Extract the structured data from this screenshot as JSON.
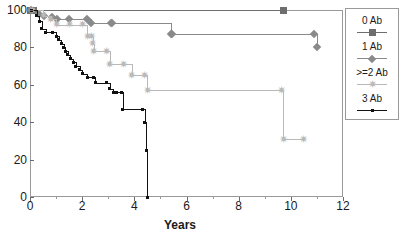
{
  "top_clipped_text": "",
  "legend": {
    "entries": [
      {
        "label": "0 Ab",
        "marker": "square-marker",
        "color": "#6e6e6e"
      },
      {
        "label": "1 Ab",
        "marker": "diamond-marker",
        "color": "#8a8a8a"
      },
      {
        "label": ">=2 Ab",
        "marker": "star-marker",
        "color": "#b9b9b9"
      },
      {
        "label": "3 Ab",
        "marker": "dot-marker",
        "color": "#111111"
      }
    ]
  },
  "chart_data": {
    "type": "line",
    "title": "",
    "xlabel": "Years",
    "ylabel": "",
    "xlim": [
      0,
      12
    ],
    "ylim": [
      0,
      100
    ],
    "xticks": [
      0,
      2,
      4,
      6,
      8,
      10,
      12
    ],
    "yticks": [
      0,
      20,
      40,
      60,
      80,
      100
    ],
    "xtick_labels": [
      "0",
      "2",
      "4",
      "6",
      "8",
      "10",
      "12"
    ],
    "ytick_labels": [
      "0",
      "20",
      "40",
      "60",
      "80",
      "100"
    ],
    "grid": false,
    "legend_position": "right-outside",
    "step_style": "post",
    "series": [
      {
        "name": "0 Ab",
        "marker": "square",
        "color": "#6e6e6e",
        "points": [
          {
            "x": 0.0,
            "y": 100
          },
          {
            "x": 0.15,
            "y": 100
          },
          {
            "x": 9.7,
            "y": 100
          }
        ]
      },
      {
        "name": "1 Ab",
        "marker": "diamond",
        "color": "#8a8a8a",
        "points": [
          {
            "x": 0.05,
            "y": 100
          },
          {
            "x": 0.35,
            "y": 98
          },
          {
            "x": 0.55,
            "y": 97
          },
          {
            "x": 0.85,
            "y": 96
          },
          {
            "x": 1.05,
            "y": 95
          },
          {
            "x": 1.5,
            "y": 95
          },
          {
            "x": 2.2,
            "y": 95
          },
          {
            "x": 2.35,
            "y": 93
          },
          {
            "x": 3.1,
            "y": 93
          },
          {
            "x": 3.15,
            "y": 93
          },
          {
            "x": 5.4,
            "y": 87
          },
          {
            "x": 5.45,
            "y": 87
          },
          {
            "x": 10.9,
            "y": 87
          },
          {
            "x": 11.0,
            "y": 80
          }
        ]
      },
      {
        "name": ">=2 Ab",
        "marker": "star",
        "color": "#b9b9b9",
        "points": [
          {
            "x": 0.1,
            "y": 100
          },
          {
            "x": 0.5,
            "y": 97
          },
          {
            "x": 0.8,
            "y": 95
          },
          {
            "x": 1.0,
            "y": 92
          },
          {
            "x": 1.5,
            "y": 92
          },
          {
            "x": 2.0,
            "y": 92
          },
          {
            "x": 2.2,
            "y": 86
          },
          {
            "x": 2.35,
            "y": 86
          },
          {
            "x": 2.4,
            "y": 82
          },
          {
            "x": 2.45,
            "y": 78
          },
          {
            "x": 2.95,
            "y": 78
          },
          {
            "x": 3.05,
            "y": 71
          },
          {
            "x": 3.6,
            "y": 71
          },
          {
            "x": 3.9,
            "y": 65
          },
          {
            "x": 4.4,
            "y": 65
          },
          {
            "x": 4.5,
            "y": 57
          },
          {
            "x": 9.65,
            "y": 57
          },
          {
            "x": 9.7,
            "y": 31
          },
          {
            "x": 10.5,
            "y": 31
          }
        ]
      },
      {
        "name": "3 Ab",
        "marker": "dot",
        "color": "#111111",
        "points": [
          {
            "x": 0.05,
            "y": 100
          },
          {
            "x": 0.25,
            "y": 97
          },
          {
            "x": 0.35,
            "y": 94
          },
          {
            "x": 0.45,
            "y": 90
          },
          {
            "x": 0.6,
            "y": 88
          },
          {
            "x": 0.85,
            "y": 88
          },
          {
            "x": 1.0,
            "y": 86
          },
          {
            "x": 1.1,
            "y": 84
          },
          {
            "x": 1.2,
            "y": 82
          },
          {
            "x": 1.3,
            "y": 80
          },
          {
            "x": 1.35,
            "y": 78
          },
          {
            "x": 1.45,
            "y": 76
          },
          {
            "x": 1.55,
            "y": 74
          },
          {
            "x": 1.65,
            "y": 72
          },
          {
            "x": 1.75,
            "y": 70
          },
          {
            "x": 1.9,
            "y": 68
          },
          {
            "x": 2.0,
            "y": 66
          },
          {
            "x": 2.2,
            "y": 64
          },
          {
            "x": 2.45,
            "y": 64
          },
          {
            "x": 2.5,
            "y": 61
          },
          {
            "x": 2.95,
            "y": 61
          },
          {
            "x": 3.05,
            "y": 58
          },
          {
            "x": 3.2,
            "y": 56
          },
          {
            "x": 3.3,
            "y": 56
          },
          {
            "x": 3.5,
            "y": 56
          },
          {
            "x": 3.55,
            "y": 47
          },
          {
            "x": 4.3,
            "y": 47
          },
          {
            "x": 4.4,
            "y": 40
          },
          {
            "x": 4.45,
            "y": 25
          },
          {
            "x": 4.5,
            "y": 0
          }
        ]
      }
    ]
  }
}
